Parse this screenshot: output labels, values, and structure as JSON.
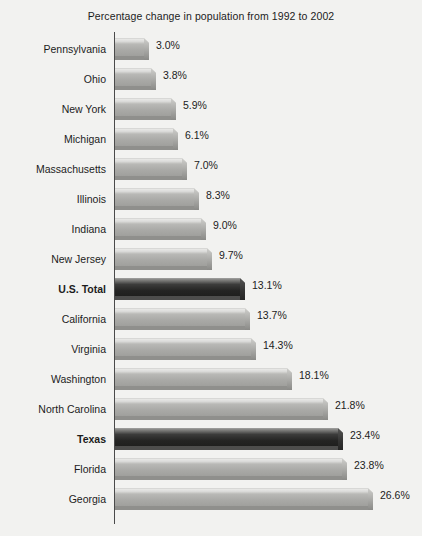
{
  "chart_data": {
    "type": "bar",
    "orientation": "horizontal",
    "title": "Percentage change in population from 1992 to 2002",
    "xlabel": "",
    "ylabel": "",
    "xlim": [
      0,
      26.6
    ],
    "grid": false,
    "legend": null,
    "value_suffix": "%",
    "categories": [
      "Pennsylvania",
      "Ohio",
      "New York",
      "Michigan",
      "Massachusetts",
      "Illinois",
      "Indiana",
      "New Jersey",
      "U.S. Total",
      "California",
      "Virginia",
      "Washington",
      "North Carolina",
      "Texas",
      "Florida",
      "Georgia"
    ],
    "values": [
      3.0,
      3.8,
      5.9,
      6.1,
      7.0,
      8.3,
      9.0,
      9.7,
      13.1,
      13.7,
      14.3,
      18.1,
      21.8,
      23.4,
      23.8,
      26.6
    ],
    "labels": [
      "3.0%",
      "3.8%",
      "5.9%",
      "6.1%",
      "7.0%",
      "8.3%",
      "9.0%",
      "9.7%",
      "13.1%",
      "13.7%",
      "14.3%",
      "18.1%",
      "21.8%",
      "23.4%",
      "23.8%",
      "26.6%"
    ],
    "highlighted": [
      "U.S. Total",
      "Texas"
    ],
    "colors": {
      "bar": "#a9a9a6",
      "bar_highlight": "#242423",
      "axis": "#4a4a4a",
      "background": "#f2f2f0",
      "text": "#1c1c1c"
    }
  },
  "rows": [
    {
      "label": "Pennsylvania",
      "value": 3.0,
      "value_label": "3.0%",
      "highlight": false
    },
    {
      "label": "Ohio",
      "value": 3.8,
      "value_label": "3.8%",
      "highlight": false
    },
    {
      "label": "New York",
      "value": 5.9,
      "value_label": "5.9%",
      "highlight": false
    },
    {
      "label": "Michigan",
      "value": 6.1,
      "value_label": "6.1%",
      "highlight": false
    },
    {
      "label": "Massachusetts",
      "value": 7.0,
      "value_label": "7.0%",
      "highlight": false
    },
    {
      "label": "Illinois",
      "value": 8.3,
      "value_label": "8.3%",
      "highlight": false
    },
    {
      "label": "Indiana",
      "value": 9.0,
      "value_label": "9.0%",
      "highlight": false
    },
    {
      "label": "New Jersey",
      "value": 9.7,
      "value_label": "9.7%",
      "highlight": false
    },
    {
      "label": "U.S. Total",
      "value": 13.1,
      "value_label": "13.1%",
      "highlight": true
    },
    {
      "label": "California",
      "value": 13.7,
      "value_label": "13.7%",
      "highlight": false
    },
    {
      "label": "Virginia",
      "value": 14.3,
      "value_label": "14.3%",
      "highlight": false
    },
    {
      "label": "Washington",
      "value": 18.1,
      "value_label": "18.1%",
      "highlight": false
    },
    {
      "label": "North Carolina",
      "value": 21.8,
      "value_label": "21.8%",
      "highlight": false
    },
    {
      "label": "Texas",
      "value": 23.4,
      "value_label": "23.4%",
      "highlight": true
    },
    {
      "label": "Florida",
      "value": 23.8,
      "value_label": "23.8%",
      "highlight": false
    },
    {
      "label": "Georgia",
      "value": 26.6,
      "value_label": "26.6%",
      "highlight": false
    }
  ],
  "layout": {
    "axis_x": 115,
    "row_pitch": 30,
    "row_top": 2,
    "px_per_unit": 9.52
  }
}
